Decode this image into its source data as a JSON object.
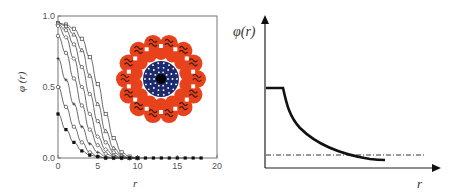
{
  "chart_data": [
    {
      "type": "line",
      "title": "",
      "xlabel": "r",
      "ylabel": "φ (r)",
      "xlim": [
        0,
        20
      ],
      "ylim": [
        0,
        1.0
      ],
      "x_ticks": [
        "0",
        "5",
        "10",
        "15",
        "20"
      ],
      "y_ticks": [
        "0.0",
        "0.5",
        "1.0"
      ],
      "grid": false,
      "legend": null,
      "inset": "micelle illustration (red corona, dark blue core)",
      "series": [
        {
          "name": "curve 1",
          "marker": "open-square",
          "x": [
            0,
            1,
            2,
            3,
            4,
            5,
            6,
            7,
            8,
            9,
            10
          ],
          "values": [
            0.95,
            0.94,
            0.91,
            0.84,
            0.71,
            0.52,
            0.31,
            0.14,
            0.04,
            0.01,
            0.0
          ]
        },
        {
          "name": "curve 2",
          "marker": "open-triangle",
          "x": [
            0,
            1,
            2,
            3,
            4,
            5,
            6,
            7,
            8,
            9,
            10
          ],
          "values": [
            0.95,
            0.93,
            0.87,
            0.76,
            0.58,
            0.38,
            0.19,
            0.07,
            0.02,
            0.0,
            0.0
          ]
        },
        {
          "name": "curve 3",
          "marker": "open-circle",
          "x": [
            0,
            1,
            2,
            3,
            4,
            5,
            6,
            7,
            8,
            9,
            10
          ],
          "values": [
            0.94,
            0.9,
            0.8,
            0.64,
            0.45,
            0.26,
            0.11,
            0.04,
            0.01,
            0.0,
            0.0
          ]
        },
        {
          "name": "curve 4",
          "marker": "open-diamond",
          "x": [
            0,
            1,
            2,
            3,
            4,
            5,
            6,
            7,
            8,
            9,
            10
          ],
          "values": [
            0.93,
            0.85,
            0.7,
            0.5,
            0.31,
            0.15,
            0.06,
            0.02,
            0.0,
            0.0,
            0.0
          ]
        },
        {
          "name": "curve 5",
          "marker": "open-circle",
          "x": [
            0,
            1,
            2,
            3,
            4,
            5,
            6,
            7,
            8,
            9,
            10
          ],
          "values": [
            0.86,
            0.74,
            0.56,
            0.37,
            0.2,
            0.09,
            0.03,
            0.01,
            0.0,
            0.0,
            0.0
          ]
        },
        {
          "name": "curve 6",
          "marker": "cross",
          "x": [
            0,
            1,
            2,
            3,
            4,
            5,
            6,
            7,
            8,
            9,
            10
          ],
          "values": [
            0.7,
            0.55,
            0.38,
            0.22,
            0.1,
            0.04,
            0.01,
            0.0,
            0.0,
            0.0,
            0.0
          ]
        },
        {
          "name": "curve 7",
          "marker": "open-circle",
          "x": [
            0,
            1,
            2,
            3,
            4,
            5,
            6,
            7,
            8,
            9,
            10
          ],
          "values": [
            0.5,
            0.36,
            0.22,
            0.11,
            0.04,
            0.01,
            0.0,
            0.0,
            0.0,
            0.0,
            0.0
          ]
        },
        {
          "name": "curve 8",
          "marker": "filled-square",
          "x": [
            0,
            1,
            2,
            3,
            4,
            5,
            6,
            7,
            8,
            9,
            10,
            11,
            12,
            13,
            14,
            15,
            16,
            17,
            18
          ],
          "values": [
            0.31,
            0.2,
            0.11,
            0.05,
            0.02,
            0.01,
            0.0,
            0.0,
            0.0,
            0.0,
            0.0,
            0.0,
            0.0,
            0.0,
            0.0,
            0.0,
            0.0,
            0.0,
            0.0
          ]
        }
      ]
    },
    {
      "type": "line",
      "title": "",
      "xlabel": "r",
      "ylabel": "φ(r)",
      "x_ticks": [],
      "y_ticks": [],
      "grid": false,
      "axes": "arrows, no ticks",
      "series": [
        {
          "name": "profile",
          "style": "solid thick",
          "description": "flat plateau then convex decay to low asymptote",
          "x": [
            0,
            0.1,
            0.12,
            0.2,
            0.3,
            0.4,
            0.5,
            0.6,
            0.7,
            0.72
          ],
          "values": [
            0.55,
            0.55,
            0.55,
            0.35,
            0.22,
            0.14,
            0.09,
            0.06,
            0.05,
            0.05
          ]
        },
        {
          "name": "bulk level",
          "style": "dash-dot",
          "x": [
            0,
            0.9
          ],
          "values": [
            0.08,
            0.08
          ]
        }
      ]
    }
  ],
  "labels": {
    "left_xlabel": "r",
    "left_ylabel": "φ (r)",
    "right_xlabel": "r",
    "right_ylabel": "φ(r)",
    "x_ticks": [
      "0",
      "5",
      "10",
      "15",
      "20"
    ],
    "y_ticks": [
      "0.0",
      "0.5",
      "1.0"
    ]
  }
}
